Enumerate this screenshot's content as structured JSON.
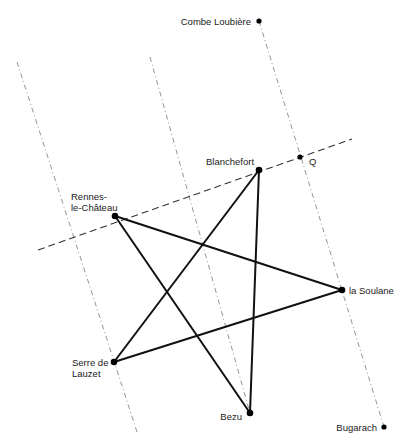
{
  "diagram": {
    "type": "geometric-map-diagram",
    "colors": {
      "background": "#ffffff",
      "star": "#111111",
      "reference": "#888888",
      "dashed": "#333333"
    },
    "points": [
      {
        "id": "combe_loubiere",
        "label": "Combe Loubière",
        "x": 259,
        "y": 21
      },
      {
        "id": "q",
        "label": "Q",
        "x": 300,
        "y": 157
      },
      {
        "id": "blanchefort",
        "label": "Blanchefort",
        "x": 259,
        "y": 170
      },
      {
        "id": "rennes",
        "label_line1": "Rennes-",
        "label_line2": "le-Château",
        "x": 115,
        "y": 216
      },
      {
        "id": "la_soulane",
        "label": "la Soulane",
        "x": 342,
        "y": 290
      },
      {
        "id": "serre",
        "label_line1": "Serre de",
        "label_line2": "Lauzet",
        "x": 114,
        "y": 362
      },
      {
        "id": "bezu",
        "label": "Bezu",
        "x": 250,
        "y": 413
      },
      {
        "id": "bugarach",
        "label": "Bugarach",
        "x": 384,
        "y": 427
      }
    ],
    "star_edges": [
      [
        "rennes",
        "la_soulane"
      ],
      [
        "la_soulane",
        "serre"
      ],
      [
        "serre",
        "blanchefort"
      ],
      [
        "blanchefort",
        "bezu"
      ],
      [
        "bezu",
        "rennes"
      ]
    ],
    "reference_lines": [
      {
        "name": "line-1",
        "from": [
          17,
          62
        ],
        "to": [
          137,
          432
        ]
      },
      {
        "name": "line-2",
        "from": [
          150,
          57
        ],
        "to": [
          250,
          413
        ]
      },
      {
        "name": "line-3",
        "from": [
          259,
          21
        ],
        "to": [
          384,
          427
        ]
      }
    ],
    "transverse_line": {
      "from": [
        38,
        250
      ],
      "to": [
        352,
        139
      ]
    }
  }
}
